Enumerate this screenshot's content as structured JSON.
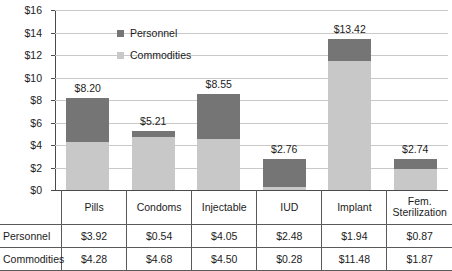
{
  "chart_data": {
    "type": "bar",
    "stacked": true,
    "title": "",
    "xlabel": "",
    "ylabel": "",
    "ylim": [
      0,
      16
    ],
    "ytick_labels": [
      "$16",
      "$14",
      "$12",
      "$10",
      "$8",
      "$6",
      "$4",
      "$2",
      "$0"
    ],
    "ytick_values": [
      16,
      14,
      12,
      10,
      8,
      6,
      4,
      2,
      0
    ],
    "grid": true,
    "legend_position": "inside-top-center",
    "categories": [
      "Pills",
      "Condoms",
      "Injectable",
      "IUD",
      "Implant",
      "Fem. Sterilization"
    ],
    "category_display": [
      "Pills",
      "Condoms",
      "Injectable",
      "IUD",
      "Implant",
      "Fem.\nSterilization"
    ],
    "series": [
      {
        "name": "Personnel",
        "color": "#757575",
        "values": [
          3.92,
          0.54,
          4.05,
          2.48,
          1.94,
          0.87
        ],
        "value_labels": [
          "$3.92",
          "$0.54",
          "$4.05",
          "$2.48",
          "$1.94",
          "$0.87"
        ]
      },
      {
        "name": "Commodities",
        "color": "#c8c8c8",
        "values": [
          4.28,
          4.68,
          4.5,
          0.28,
          11.48,
          1.87
        ],
        "value_labels": [
          "$4.28",
          "$4.68",
          "$4.50",
          "$0.28",
          "$11.48",
          "$1.87"
        ]
      }
    ],
    "totals": [
      8.2,
      5.21,
      8.55,
      2.76,
      13.42,
      2.74
    ],
    "total_labels": [
      "$8.20",
      "$5.21",
      "$8.55",
      "$2.76",
      "$13.42",
      "$2.74"
    ]
  },
  "legend": {
    "items": [
      {
        "label": "Personnel",
        "color": "#757575"
      },
      {
        "label": "Commodities",
        "color": "#c8c8c8"
      }
    ]
  },
  "table": {
    "header_blank": "",
    "columns": [
      "Pills",
      "Condoms",
      "Injectable",
      "IUD",
      "Implant",
      "Fem. Sterilization"
    ],
    "column_line1": [
      "Pills",
      "Condoms",
      "Injectable",
      "IUD",
      "Implant",
      "Fem."
    ],
    "column_line2": [
      "",
      "",
      "",
      "",
      "",
      "Sterilization"
    ],
    "rows": [
      {
        "label": "Personnel",
        "cells": [
          "$3.92",
          "$0.54",
          "$4.05",
          "$2.48",
          "$1.94",
          "$0.87"
        ]
      },
      {
        "label": "Commodities",
        "cells": [
          "$4.28",
          "$4.68",
          "$4.50",
          "$0.28",
          "$11.48",
          "$1.87"
        ]
      }
    ]
  }
}
